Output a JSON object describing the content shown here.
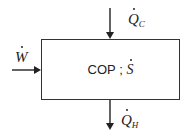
{
  "diagram": {
    "box": {
      "label_text": "COP ;",
      "label_symbol": "S"
    },
    "inputs": [
      {
        "id": "work",
        "symbol": "W",
        "subscript": "",
        "direction": "in-left"
      },
      {
        "id": "heat_cold",
        "symbol": "Q",
        "subscript": "C",
        "direction": "in-top"
      }
    ],
    "outputs": [
      {
        "id": "heat_hot",
        "symbol": "Q",
        "subscript": "H",
        "direction": "out-bottom"
      }
    ],
    "colors": {
      "stroke": "#333333",
      "text": "#222222",
      "background": "#ffffff"
    }
  }
}
